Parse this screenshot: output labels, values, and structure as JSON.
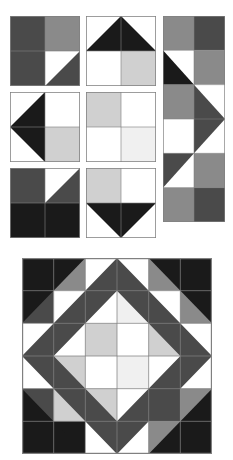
{
  "figure": {
    "type": "quilt-pattern-diagram",
    "background": "#ffffff",
    "grid_line_color": "#808080",
    "grid_line_width": 1
  },
  "palette": {
    "white": "#ffffff",
    "very_light_gray": "#f0f0f0",
    "light_gray": "#d0d0d0",
    "medium_gray": "#8a8a8a",
    "dark_gray": "#4a4a4a",
    "black": "#1a1a1a",
    "outline": "#808080"
  },
  "sampler": {
    "label": "Block sampler",
    "columns": 3,
    "rows": 3,
    "blocks": [
      {
        "id": "block-1",
        "name": "dark-corner-with-white-triangle",
        "position": {
          "x": 10,
          "y": 16,
          "w": 70,
          "h": 70
        },
        "cells": [
          {
            "row": 0,
            "col": 0,
            "fill": "dark_gray",
            "shape": "solid"
          },
          {
            "row": 0,
            "col": 1,
            "fill": "medium_gray",
            "shape": "solid"
          },
          {
            "row": 1,
            "col": 0,
            "fill": "dark_gray",
            "shape": "solid"
          },
          {
            "row": 1,
            "col": 1,
            "fill": "white",
            "shape": "half-square-triangle",
            "triangle_fill": "dark_gray",
            "triangle_corner": "bottom-right"
          }
        ]
      },
      {
        "id": "block-2",
        "name": "black-peak-triangle-up",
        "position": {
          "x": 86,
          "y": 16,
          "w": 70,
          "h": 70
        },
        "cells": [
          {
            "row": 0,
            "col": 0,
            "fill": "white",
            "shape": "solid"
          },
          {
            "row": 0,
            "col": 1,
            "fill": "white",
            "shape": "solid"
          },
          {
            "row": 1,
            "col": 0,
            "fill": "white",
            "shape": "solid"
          },
          {
            "row": 1,
            "col": 1,
            "fill": "light_gray",
            "shape": "solid"
          }
        ],
        "overlay": {
          "shape": "triangle",
          "fill": "black",
          "points": "up",
          "span": "top-half"
        }
      },
      {
        "id": "block-3",
        "name": "tall-arrow-column",
        "position": {
          "x": 163,
          "y": 16,
          "w": 62,
          "h": 206
        },
        "columns": 2,
        "rows": 6,
        "cells": [
          {
            "row": 0,
            "col": 0,
            "fill": "medium_gray",
            "shape": "solid"
          },
          {
            "row": 0,
            "col": 1,
            "fill": "dark_gray",
            "shape": "solid"
          },
          {
            "row": 1,
            "col": 0,
            "fill": "white",
            "shape": "half-square-triangle",
            "triangle_fill": "black",
            "triangle_corner": "bottom-left"
          },
          {
            "row": 1,
            "col": 1,
            "fill": "medium_gray",
            "shape": "solid"
          },
          {
            "row": 2,
            "col": 0,
            "fill": "medium_gray",
            "shape": "solid"
          },
          {
            "row": 2,
            "col": 1,
            "fill": "white",
            "shape": "half-square-triangle",
            "triangle_fill": "dark_gray",
            "triangle_corner": "bottom-left"
          },
          {
            "row": 3,
            "col": 0,
            "fill": "white",
            "shape": "solid"
          },
          {
            "row": 3,
            "col": 1,
            "fill": "white",
            "shape": "half-square-triangle",
            "triangle_fill": "dark_gray",
            "triangle_corner": "top-left"
          },
          {
            "row": 4,
            "col": 0,
            "fill": "white",
            "shape": "half-square-triangle",
            "triangle_fill": "dark_gray",
            "triangle_corner": "top-left"
          },
          {
            "row": 4,
            "col": 1,
            "fill": "medium_gray",
            "shape": "solid"
          },
          {
            "row": 5,
            "col": 0,
            "fill": "medium_gray",
            "shape": "solid"
          },
          {
            "row": 5,
            "col": 1,
            "fill": "dark_gray",
            "shape": "solid"
          }
        ]
      },
      {
        "id": "block-4",
        "name": "black-arrow-pointing-left",
        "position": {
          "x": 10,
          "y": 92,
          "w": 70,
          "h": 70
        },
        "cells": [
          {
            "row": 0,
            "col": 0,
            "fill": "white",
            "shape": "solid"
          },
          {
            "row": 0,
            "col": 1,
            "fill": "white",
            "shape": "solid"
          },
          {
            "row": 1,
            "col": 0,
            "fill": "white",
            "shape": "solid"
          },
          {
            "row": 1,
            "col": 1,
            "fill": "light_gray",
            "shape": "solid"
          }
        ],
        "overlay": {
          "shape": "triangle",
          "fill": "black",
          "points": "left",
          "span": "left-half"
        }
      },
      {
        "id": "block-5",
        "name": "four-patch-light",
        "position": {
          "x": 86,
          "y": 92,
          "w": 70,
          "h": 70
        },
        "cells": [
          {
            "row": 0,
            "col": 0,
            "fill": "light_gray",
            "shape": "solid"
          },
          {
            "row": 0,
            "col": 1,
            "fill": "white",
            "shape": "solid"
          },
          {
            "row": 1,
            "col": 0,
            "fill": "white",
            "shape": "solid"
          },
          {
            "row": 1,
            "col": 1,
            "fill": "very_light_gray",
            "shape": "solid"
          }
        ]
      },
      {
        "id": "block-6",
        "name": "black-base-with-white-triangle",
        "position": {
          "x": 10,
          "y": 168,
          "w": 70,
          "h": 70
        },
        "cells": [
          {
            "row": 0,
            "col": 0,
            "fill": "dark_gray",
            "shape": "solid"
          },
          {
            "row": 0,
            "col": 1,
            "fill": "white",
            "shape": "half-square-triangle",
            "triangle_fill": "dark_gray",
            "triangle_corner": "bottom-right"
          },
          {
            "row": 1,
            "col": 0,
            "fill": "black",
            "shape": "solid"
          },
          {
            "row": 1,
            "col": 1,
            "fill": "black",
            "shape": "solid"
          }
        ]
      },
      {
        "id": "block-7",
        "name": "black-triangle-down",
        "position": {
          "x": 86,
          "y": 168,
          "w": 70,
          "h": 70
        },
        "cells": [
          {
            "row": 0,
            "col": 0,
            "fill": "light_gray",
            "shape": "solid"
          },
          {
            "row": 0,
            "col": 1,
            "fill": "white",
            "shape": "solid"
          },
          {
            "row": 1,
            "col": 0,
            "fill": "white",
            "shape": "solid"
          },
          {
            "row": 1,
            "col": 1,
            "fill": "white",
            "shape": "solid"
          }
        ],
        "overlay": {
          "shape": "triangle",
          "fill": "black",
          "points": "down",
          "span": "bottom-half"
        }
      }
    ]
  },
  "composite": {
    "label": "Assembled quilt top",
    "position": {
      "x": 22,
      "y": 258,
      "w": 190,
      "h": 196
    },
    "grid": {
      "rows": 6,
      "cols": 6
    },
    "description": "Six-by-six patch grid with a large dark diamond on point overlaying the center",
    "base_cells": [
      [
        "dark_gray",
        "medium_gray",
        "white",
        "white",
        "medium_gray",
        "dark_gray"
      ],
      [
        "dark_gray",
        "white",
        "white",
        "very_light_gray",
        "white",
        "medium_gray"
      ],
      [
        "white",
        "white",
        "light_gray",
        "white",
        "light_gray",
        "white"
      ],
      [
        "white",
        "light_gray",
        "white",
        "very_light_gray",
        "white",
        "white"
      ],
      [
        "dark_gray",
        "light_gray",
        "light_gray",
        "white",
        "dark_gray",
        "medium_gray"
      ],
      [
        "black",
        "black",
        "white",
        "white",
        "medium_gray",
        "dark_gray"
      ]
    ],
    "diamond": {
      "fill": "dark_gray",
      "points_fraction": [
        [
          0.5,
          0.0
        ],
        [
          1.0,
          0.5
        ],
        [
          0.5,
          1.0
        ],
        [
          0.0,
          0.5
        ]
      ],
      "inner_hole_fraction": [
        [
          0.5,
          0.1667
        ],
        [
          0.8333,
          0.5
        ],
        [
          0.5,
          0.8333
        ],
        [
          0.1667,
          0.5
        ]
      ]
    },
    "corner_triangles": [
      {
        "corner": "top-left",
        "fill": "black",
        "size_fraction": 0.1667
      },
      {
        "corner": "top-right",
        "fill": "black",
        "size_fraction": 0.1667
      },
      {
        "corner": "bottom-left",
        "fill": "black",
        "size_fraction": 0.1667
      },
      {
        "corner": "bottom-right",
        "fill": "black",
        "size_fraction": 0.1667
      }
    ]
  }
}
